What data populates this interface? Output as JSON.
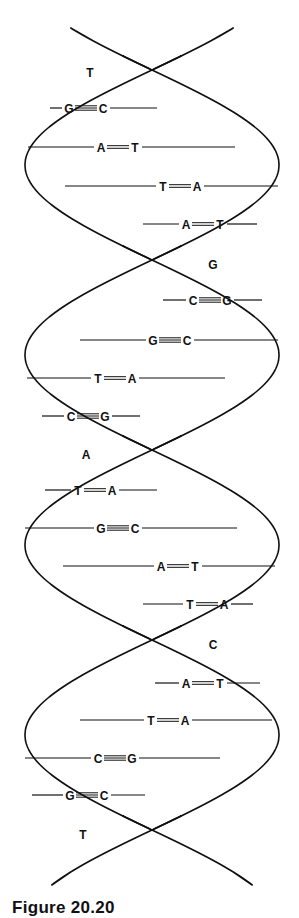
{
  "figure": {
    "caption": "Figure 20.20",
    "colors": {
      "strand_back": "#c9c9c9",
      "strand_front": "#e9e9e9",
      "outline": "#111111",
      "background": "#ffffff"
    }
  },
  "crossover_bases": [
    {
      "label": "T",
      "x": 90,
      "y": 73
    },
    {
      "label": "G",
      "x": 213,
      "y": 265
    },
    {
      "label": "A",
      "x": 86,
      "y": 455
    },
    {
      "label": "C",
      "x": 213,
      "y": 645
    },
    {
      "label": "T",
      "x": 83,
      "y": 835
    }
  ],
  "base_pairs": [
    {
      "left": "G",
      "right": "C",
      "bonds": 3,
      "y": 108,
      "x1": 50,
      "x2": 157,
      "cx": 86
    },
    {
      "left": "A",
      "right": "T",
      "bonds": 2,
      "y": 147,
      "x1": 28,
      "x2": 235,
      "cx": 118
    },
    {
      "left": "T",
      "right": "A",
      "bonds": 2,
      "y": 186,
      "x1": 65,
      "x2": 278,
      "cx": 180
    },
    {
      "left": "A",
      "right": "T",
      "bonds": 2,
      "y": 224,
      "x1": 143,
      "x2": 257,
      "cx": 203
    },
    {
      "left": "C",
      "right": "G",
      "bonds": 3,
      "y": 300,
      "x1": 163,
      "x2": 262,
      "cx": 210
    },
    {
      "left": "G",
      "right": "C",
      "bonds": 3,
      "y": 340,
      "x1": 80,
      "x2": 278,
      "cx": 170
    },
    {
      "left": "T",
      "right": "A",
      "bonds": 2,
      "y": 378,
      "x1": 27,
      "x2": 225,
      "cx": 115
    },
    {
      "left": "C",
      "right": "G",
      "bonds": 3,
      "y": 416,
      "x1": 42,
      "x2": 140,
      "cx": 88
    },
    {
      "left": "T",
      "right": "A",
      "bonds": 2,
      "y": 490,
      "x1": 45,
      "x2": 157,
      "cx": 95
    },
    {
      "left": "G",
      "right": "C",
      "bonds": 3,
      "y": 528,
      "x1": 25,
      "x2": 237,
      "cx": 118
    },
    {
      "left": "A",
      "right": "T",
      "bonds": 2,
      "y": 566,
      "x1": 63,
      "x2": 275,
      "cx": 178
    },
    {
      "left": "T",
      "right": "A",
      "bonds": 2,
      "y": 604,
      "x1": 143,
      "x2": 253,
      "cx": 207
    },
    {
      "left": "A",
      "right": "T",
      "bonds": 2,
      "y": 683,
      "x1": 155,
      "x2": 260,
      "cx": 203
    },
    {
      "left": "T",
      "right": "A",
      "bonds": 2,
      "y": 720,
      "x1": 80,
      "x2": 272,
      "cx": 168
    },
    {
      "left": "C",
      "right": "G",
      "bonds": 3,
      "y": 758,
      "x1": 25,
      "x2": 220,
      "cx": 115
    },
    {
      "left": "G",
      "right": "C",
      "bonds": 3,
      "y": 795,
      "x1": 32,
      "x2": 145,
      "cx": 87
    }
  ]
}
